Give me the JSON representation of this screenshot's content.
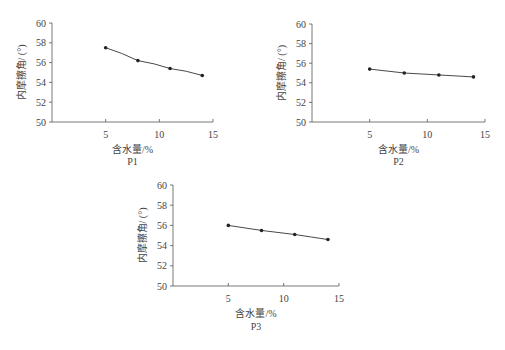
{
  "chart_data": [
    {
      "type": "line",
      "title": "P1",
      "xlabel": "含水量/%",
      "ylabel": "内摩擦角/ (°)",
      "xlim": [
        0,
        15
      ],
      "ylim": [
        50,
        60
      ],
      "xticks": [
        5,
        10,
        15
      ],
      "yticks": [
        50,
        52,
        54,
        56,
        58,
        60
      ],
      "grid": false,
      "x": [
        5,
        8,
        11,
        14
      ],
      "series": [
        {
          "name": "P1",
          "values": [
            57.5,
            56.2,
            55.4,
            54.7
          ]
        }
      ]
    },
    {
      "type": "line",
      "title": "P2",
      "xlabel": "含水量/%",
      "ylabel": "内摩擦角/ (°)",
      "xlim": [
        0,
        15
      ],
      "ylim": [
        50,
        60
      ],
      "xticks": [
        5,
        10,
        15
      ],
      "yticks": [
        50,
        52,
        54,
        56,
        58,
        60
      ],
      "grid": false,
      "x": [
        5,
        8,
        11,
        14
      ],
      "series": [
        {
          "name": "P2",
          "values": [
            55.4,
            55.0,
            54.8,
            54.6
          ]
        }
      ]
    },
    {
      "type": "line",
      "title": "P3",
      "xlabel": "含水量/%",
      "ylabel": "内摩擦角/ (°)",
      "xlim": [
        0,
        15
      ],
      "ylim": [
        50,
        60
      ],
      "xticks": [
        5,
        10,
        15
      ],
      "yticks": [
        50,
        52,
        54,
        56,
        58,
        60
      ],
      "grid": false,
      "x": [
        5,
        8,
        11,
        14
      ],
      "series": [
        {
          "name": "P3",
          "values": [
            56.0,
            55.5,
            55.1,
            54.6
          ]
        }
      ]
    }
  ],
  "panels": [
    {
      "title": "P1",
      "xlabel": "含水量/%",
      "ylabel": "内摩擦角/ (°)"
    },
    {
      "title": "P2",
      "xlabel": "含水量/%",
      "ylabel": "内摩擦角/ (°)"
    },
    {
      "title": "P3",
      "xlabel": "含水量/%",
      "ylabel": "内摩擦角/ (°)"
    }
  ]
}
